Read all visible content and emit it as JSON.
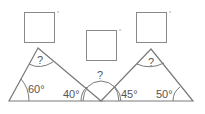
{
  "diagram": {
    "boxes": [
      {
        "id": "left",
        "unit": "°"
      },
      {
        "id": "middle",
        "unit": "°"
      },
      {
        "id": "right",
        "unit": "°"
      }
    ],
    "left_triangle": {
      "apex_label": "?",
      "base_left_angle": "60°",
      "base_right_angle": "40°"
    },
    "middle_angle_label": "?",
    "right_triangle": {
      "apex_label": "?",
      "base_left_angle": "45°",
      "base_right_angle": "50°"
    },
    "colors": {
      "line": "#7a7a7a",
      "box": "#8a8a8a",
      "text": "#555555"
    }
  }
}
